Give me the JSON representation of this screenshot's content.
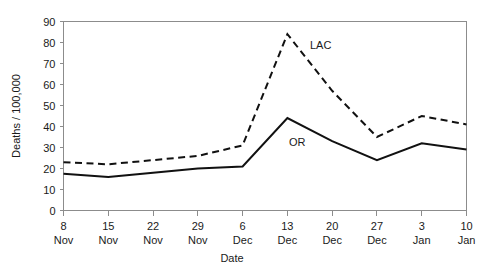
{
  "chart_data": {
    "type": "line",
    "title": "",
    "xlabel": "Date",
    "ylabel": "Deaths / 100,000",
    "ylim": [
      0,
      90
    ],
    "yticks": [
      0,
      10,
      20,
      30,
      40,
      50,
      60,
      70,
      80,
      90
    ],
    "ytick_labels": [
      "0",
      "10",
      "20",
      "30",
      "40",
      "50",
      "60",
      "70",
      "80",
      "90"
    ],
    "grid": false,
    "legend_position": "inline-annotation",
    "categories": [
      "8 Nov",
      "15 Nov",
      "22 Nov",
      "29 Nov",
      "6 Dec",
      "13 Dec",
      "20 Dec",
      "27 Dec",
      "3 Jan",
      "10 Jan"
    ],
    "xtick_day": [
      "8",
      "15",
      "22",
      "29",
      "6",
      "13",
      "20",
      "27",
      "3",
      "10"
    ],
    "xtick_month": [
      "Nov",
      "Nov",
      "Nov",
      "Nov",
      "Dec",
      "Dec",
      "Dec",
      "Dec",
      "Jan",
      "Jan"
    ],
    "series": [
      {
        "name": "LAC",
        "style": "dashed",
        "color": "#111111",
        "label_text": "LAC",
        "values": [
          23,
          22,
          24,
          26,
          31,
          84,
          57,
          35,
          45,
          41
        ]
      },
      {
        "name": "OR",
        "style": "solid",
        "color": "#111111",
        "label_text": "OR",
        "values": [
          17.5,
          16,
          18,
          20,
          21,
          44,
          33,
          24,
          32,
          29
        ]
      }
    ]
  },
  "axes": {
    "y_axis_title": "Deaths / 100,000",
    "x_axis_title": "Date"
  },
  "annotations": {
    "lac_label": "LAC",
    "or_label": "OR"
  },
  "colors": {
    "line": "#111111",
    "frame": "#8c8c8c",
    "text": "#1a1a1a",
    "background": "#ffffff"
  }
}
